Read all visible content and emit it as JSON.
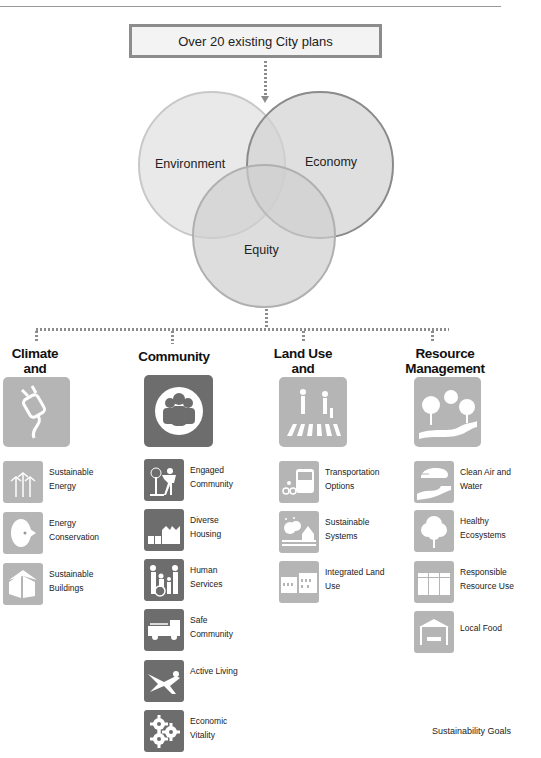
{
  "header": {
    "plans_box": "Over 20 existing City plans"
  },
  "venn": {
    "circles": [
      {
        "label": "Environment",
        "cx": 212,
        "cy": 165,
        "r": 73,
        "fill": "#e4e4e4",
        "stroke": "#c8c8c8"
      },
      {
        "label": "Economy",
        "cx": 320,
        "cy": 165,
        "r": 73,
        "fill": "#d9d9d9",
        "stroke": "#8a8a8a"
      },
      {
        "label": "Equity",
        "cx": 264,
        "cy": 236,
        "r": 71,
        "fill": "#d4d4d4",
        "stroke": "#b0b0b0"
      }
    ]
  },
  "columns": [
    {
      "title_line1": "Climate and",
      "title_line2": "Energy",
      "icon": "plug-icon",
      "items": [
        {
          "label_line1": "Sustainable",
          "label_line2": "Energy",
          "icon": "wind-turbines-icon"
        },
        {
          "label_line1": "Energy",
          "label_line2": "Conservation",
          "icon": "light-bulb-icon"
        },
        {
          "label_line1": "Sustainable",
          "label_line2": "Buildings",
          "icon": "house-icon"
        }
      ]
    },
    {
      "title_line1": "Community",
      "title_line2": "",
      "icon": "people-group-icon",
      "items": [
        {
          "label_line1": "Engaged",
          "label_line2": "Community",
          "icon": "person-planting-tree-icon"
        },
        {
          "label_line1": "Diverse",
          "label_line2": "Housing",
          "icon": "housing-icon"
        },
        {
          "label_line1": "Human",
          "label_line2": "Services",
          "icon": "family-wheelchair-icon"
        },
        {
          "label_line1": "Safe",
          "label_line2": "Community",
          "icon": "fire-truck-icon"
        },
        {
          "label_line1": "Active Living",
          "label_line2": "",
          "icon": "swimmer-icon"
        },
        {
          "label_line1": "Economic",
          "label_line2": "Vitality",
          "icon": "gears-icon"
        }
      ]
    },
    {
      "title_line1": "Land Use",
      "title_line2": "and Access",
      "icon": "crosswalk-pedestrians-icon",
      "items": [
        {
          "label_line1": "Transportation",
          "label_line2": "Options",
          "icon": "bus-bicycle-icon"
        },
        {
          "label_line1": "Sustainable",
          "label_line2": "Systems",
          "icon": "neighborhood-icon"
        },
        {
          "label_line1": "Integrated Land",
          "label_line2": "Use",
          "icon": "buildings-icon"
        }
      ]
    },
    {
      "title_line1": "Resource",
      "title_line2": "Management",
      "icon": "trees-path-icon",
      "items": [
        {
          "label_line1": "Clean Air and",
          "label_line2": "Water",
          "icon": "cloud-river-icon"
        },
        {
          "label_line1": "Healthy",
          "label_line2": "Ecosystems",
          "icon": "tree-icon"
        },
        {
          "label_line1": "Responsible",
          "label_line2": "Resource Use",
          "icon": "recycling-bins-icon"
        },
        {
          "label_line1": "Local Food",
          "label_line2": "",
          "icon": "market-tent-icon"
        }
      ]
    }
  ],
  "footer": {
    "caption": "Sustainability Goals"
  },
  "colors": {
    "icon_light": "#b5b5b5",
    "icon_dark": "#6d6d6d",
    "connector": "#8c8c8c"
  }
}
